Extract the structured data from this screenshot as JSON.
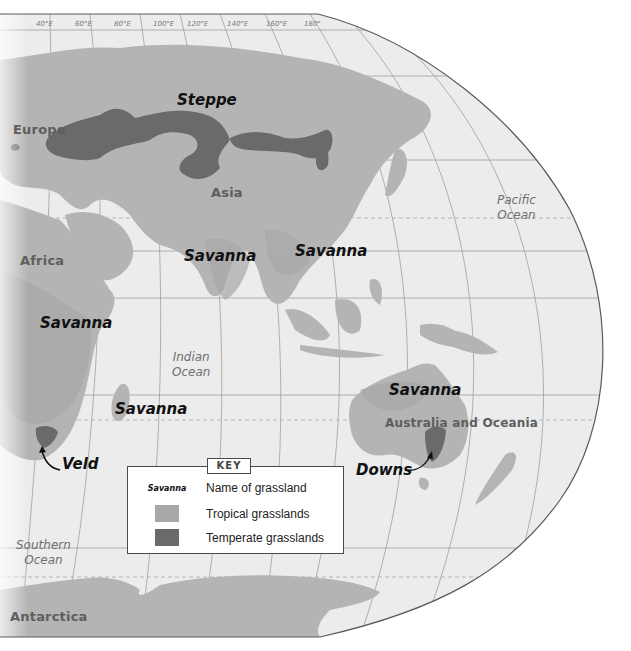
{
  "map": {
    "title_hidden": "World grasslands map (Asia, Africa, Australia region)",
    "colors": {
      "ocean": "#ececec",
      "land": "#b4b4b4",
      "tropical_grassland": "#a6a6a6",
      "temperate_grassland": "#6a6a6a",
      "graticule": "#9a9a9a",
      "border": "#5a5a5a",
      "background": "#ffffff"
    },
    "longitude_labels": [
      "40°E",
      "60°E",
      "80°E",
      "100°E",
      "120°E",
      "140°E",
      "160°E",
      "180°"
    ],
    "continents": {
      "europe": "Europe",
      "asia": "Asia",
      "africa": "Africa",
      "australia": "Australia and Oceania",
      "antarctica": "Antarctica"
    },
    "oceans": {
      "pacific_line1": "Pacific",
      "pacific_line2": "Ocean",
      "indian_line1": "Indian",
      "indian_line2": "Ocean",
      "southern_line1": "Southern",
      "southern_line2": "Ocean"
    },
    "grasslands": {
      "steppe": "Steppe",
      "savanna_india": "Savanna",
      "savanna_se_asia": "Savanna",
      "savanna_east_africa": "Savanna",
      "savanna_madagascar": "Savanna",
      "savanna_australia": "Savanna",
      "veld": "Veld",
      "downs": "Downs"
    }
  },
  "key": {
    "title": "KEY",
    "items": [
      {
        "sample": "Savanna",
        "label": "Name of grassland"
      },
      {
        "swatch": "tropical",
        "label": "Tropical grasslands"
      },
      {
        "swatch": "temperate",
        "label": "Temperate grasslands"
      }
    ]
  }
}
